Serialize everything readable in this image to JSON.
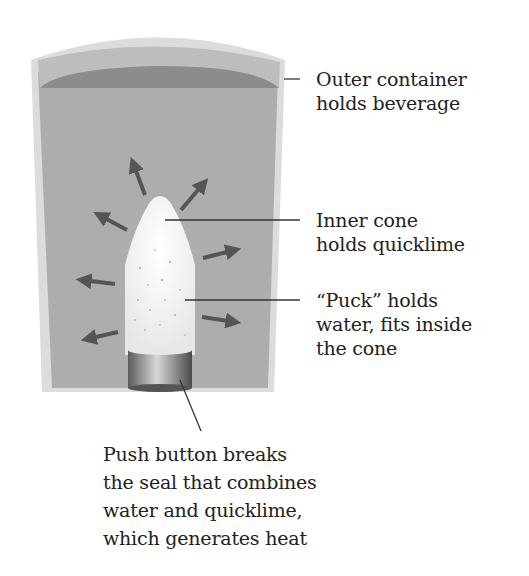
{
  "diagram": {
    "labels": {
      "outer_container": [
        "Outer container",
        "holds beverage"
      ],
      "inner_cone": [
        "Inner cone",
        "holds quicklime"
      ],
      "puck": [
        "“Puck” holds",
        "water, fits inside",
        "the cone"
      ],
      "push_button": [
        "Push button breaks",
        "the seal that combines",
        "water and quicklime,",
        "which generates heat"
      ]
    },
    "parts": [
      "outer-container",
      "beverage",
      "inner-cone",
      "puck",
      "push-button",
      "heat-arrows"
    ],
    "heat_arrow_count": 8,
    "colors": {
      "container_wall": "#d9d9d9",
      "beverage": "#a9a9a9",
      "beverage_surface": "#8a8a8a",
      "cone": "#f2f2f2",
      "button": "#7a7a7a",
      "arrow": "#555555",
      "leader_line": "#333333"
    }
  }
}
